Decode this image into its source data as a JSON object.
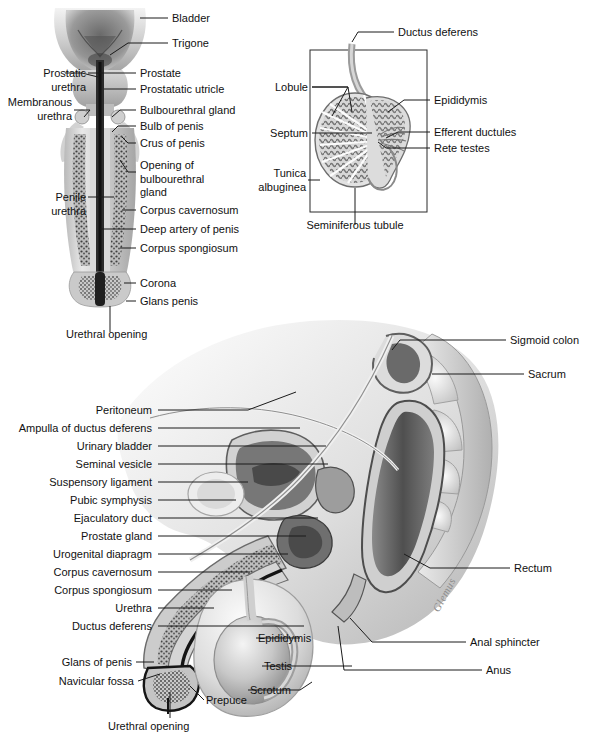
{
  "figure": {
    "background": "#ffffff",
    "ink": "#141414",
    "signature": "Glemus"
  },
  "panels": {
    "penis_frontal": {
      "name": "Frontal section of bladder, prostate and penis",
      "labels": [
        {
          "id": "bladder",
          "text": "Bladder"
        },
        {
          "id": "trigone",
          "text": "Trigone"
        },
        {
          "id": "prostatic-urethra",
          "text": "Prostatic\nurethra"
        },
        {
          "id": "prostate",
          "text": "Prostate"
        },
        {
          "id": "prostatatic-utricle",
          "text": "Prostatatic utricle"
        },
        {
          "id": "membranous-urethra",
          "text": "Membranous\nurethra"
        },
        {
          "id": "bulbourethral-gland",
          "text": "Bulbourethral gland"
        },
        {
          "id": "bulb-of-penis",
          "text": "Bulb of penis"
        },
        {
          "id": "crus-of-penis",
          "text": "Crus of penis"
        },
        {
          "id": "opening-of-bulbourethral-gland",
          "text": "Opening of\nbulbourethral\ngland"
        },
        {
          "id": "penile-urethra",
          "text": "Penile\nurethra"
        },
        {
          "id": "corpus-cavernosum",
          "text": "Corpus cavernosum"
        },
        {
          "id": "deep-artery-of-penis",
          "text": "Deep artery of penis"
        },
        {
          "id": "corpus-spongiosum",
          "text": "Corpus spongiosum"
        },
        {
          "id": "corona",
          "text": "Corona"
        },
        {
          "id": "glans-penis",
          "text": "Glans penis"
        },
        {
          "id": "urethral-opening",
          "text": "Urethral opening"
        }
      ]
    },
    "testis": {
      "name": "Sagittal section of testis and epididymis",
      "labels": [
        {
          "id": "ductus-deferens",
          "text": "Ductus deferens"
        },
        {
          "id": "lobule",
          "text": "Lobule"
        },
        {
          "id": "epididymis",
          "text": "Epididymis"
        },
        {
          "id": "septum",
          "text": "Septum"
        },
        {
          "id": "efferent-ductules",
          "text": "Efferent ductules"
        },
        {
          "id": "rete-testes",
          "text": "Rete testes"
        },
        {
          "id": "tunica-albuginea",
          "text": "Tunica\nalbuginea"
        },
        {
          "id": "seminiferous-tubule",
          "text": "Seminiferous tubule"
        }
      ]
    },
    "sagittal": {
      "name": "Midsagittal section of male pelvis",
      "labels_left": [
        {
          "id": "peritoneum",
          "text": "Peritoneum"
        },
        {
          "id": "ampulla-of-ductus-deferens",
          "text": "Ampulla of ductus deferens"
        },
        {
          "id": "urinary-bladder",
          "text": "Urinary bladder"
        },
        {
          "id": "seminal-vesicle",
          "text": "Seminal vesicle"
        },
        {
          "id": "suspensory-ligament",
          "text": "Suspensory ligament"
        },
        {
          "id": "pubic-symphysis",
          "text": "Pubic symphysis"
        },
        {
          "id": "ejaculatory-duct",
          "text": "Ejaculatory duct"
        },
        {
          "id": "prostate-gland",
          "text": "Prostate gland"
        },
        {
          "id": "urogenital-diapragm",
          "text": "Urogenital diapragm"
        },
        {
          "id": "corpus-cavernosum",
          "text": "Corpus cavernosum"
        },
        {
          "id": "corpus-spongiosum",
          "text": "Corpus spongiosum"
        },
        {
          "id": "urethra",
          "text": "Urethra"
        },
        {
          "id": "ductus-deferens",
          "text": "Ductus deferens"
        },
        {
          "id": "glans-of-penis",
          "text": "Glans of penis"
        },
        {
          "id": "navicular-fossa",
          "text": "Navicular fossa"
        }
      ],
      "labels_right": [
        {
          "id": "sigmoid-colon",
          "text": "Sigmoid colon"
        },
        {
          "id": "sacrum",
          "text": "Sacrum"
        },
        {
          "id": "rectum",
          "text": "Rectum"
        },
        {
          "id": "anal-sphincter",
          "text": "Anal sphincter"
        },
        {
          "id": "anus",
          "text": "Anus"
        },
        {
          "id": "epididymis",
          "text": "Epididymis"
        },
        {
          "id": "testis",
          "text": "Testis"
        },
        {
          "id": "scrotum",
          "text": "Scrotum"
        }
      ],
      "labels_bottom": [
        {
          "id": "prepuce",
          "text": "Prepuce"
        },
        {
          "id": "urethral-opening",
          "text": "Urethral opening"
        }
      ]
    }
  }
}
